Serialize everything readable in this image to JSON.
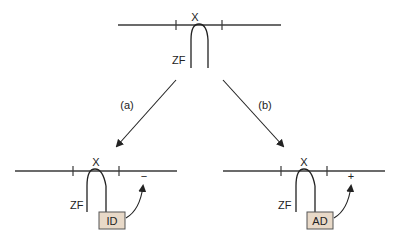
{
  "diagram": {
    "top": {
      "locus_label": "X",
      "factor_label": "ZF"
    },
    "branches": [
      {
        "label": "(a)",
        "locus_label": "X",
        "factor_label": "ZF",
        "domain_label": "ID",
        "effect_sign": "−"
      },
      {
        "label": "(b)",
        "locus_label": "X",
        "factor_label": "ZF",
        "domain_label": "AD",
        "effect_sign": "+"
      }
    ],
    "colors": {
      "line": "#3a3a3a",
      "box_fill": "#e8d9c8",
      "box_stroke": "#555555"
    }
  }
}
